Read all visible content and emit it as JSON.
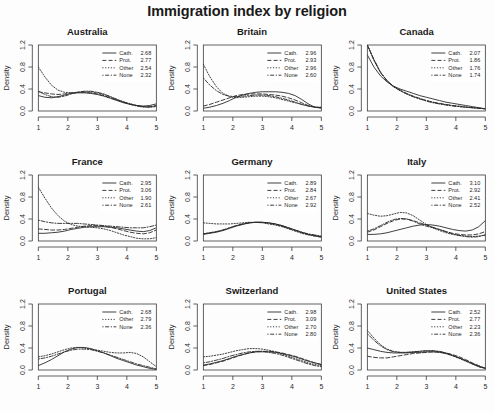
{
  "chart_data": {
    "type": "line",
    "title": "Immigration index by religion",
    "xlabel": "",
    "ylabel": "Density",
    "xlim": [
      1,
      5
    ],
    "ylim": [
      0.0,
      1.2
    ],
    "xticks": [
      "1",
      "2",
      "3",
      "4",
      "5"
    ],
    "yticks": [
      "0.0",
      "0.4",
      "0.8",
      "1.2"
    ],
    "grid": false,
    "legend_position": "top-right",
    "layout": "3x3 small multiples",
    "series_names": [
      "Cath.",
      "Prot.",
      "Other",
      "None"
    ],
    "line_styles": [
      "solid",
      "dashed",
      "dotted",
      "dotdash"
    ],
    "panels": [
      {
        "name": "Australia",
        "legend": [
          {
            "label": "Cath.",
            "value": "2.68",
            "style": "solid"
          },
          {
            "label": "Prot.",
            "value": "2.77",
            "style": "dashed"
          },
          {
            "label": "Other",
            "value": "2.54",
            "style": "dotted"
          },
          {
            "label": "None",
            "value": "2.32",
            "style": "dotdash"
          }
        ],
        "curves": {
          "Cath.": [
            0.28,
            0.25,
            0.24,
            0.26,
            0.29,
            0.32,
            0.33,
            0.33,
            0.32,
            0.3,
            0.27,
            0.23,
            0.19,
            0.15,
            0.12,
            0.1,
            0.09,
            0.1,
            0.13
          ],
          "Prot.": [
            0.35,
            0.33,
            0.31,
            0.3,
            0.31,
            0.33,
            0.34,
            0.34,
            0.33,
            0.31,
            0.28,
            0.24,
            0.2,
            0.16,
            0.13,
            0.1,
            0.08,
            0.08,
            0.1
          ],
          "Other": [
            0.8,
            0.62,
            0.47,
            0.38,
            0.34,
            0.33,
            0.34,
            0.35,
            0.35,
            0.33,
            0.3,
            0.26,
            0.21,
            0.17,
            0.13,
            0.1,
            0.08,
            0.07,
            0.08
          ],
          "None": [
            0.36,
            0.3,
            0.26,
            0.25,
            0.27,
            0.31,
            0.34,
            0.36,
            0.36,
            0.34,
            0.31,
            0.26,
            0.21,
            0.16,
            0.12,
            0.09,
            0.07,
            0.07,
            0.09
          ]
        }
      },
      {
        "name": "Britain",
        "legend": [
          {
            "label": "Cath.",
            "value": "2.96",
            "style": "solid"
          },
          {
            "label": "Prot.",
            "value": "2.93",
            "style": "dashed"
          },
          {
            "label": "Other",
            "value": "2.96",
            "style": "dotted"
          },
          {
            "label": "None",
            "value": "2.60",
            "style": "dotdash"
          }
        ],
        "curves": {
          "Cath.": [
            0.05,
            0.07,
            0.1,
            0.14,
            0.19,
            0.25,
            0.29,
            0.32,
            0.34,
            0.35,
            0.35,
            0.35,
            0.34,
            0.32,
            0.28,
            0.21,
            0.13,
            0.07,
            0.05
          ],
          "Prot.": [
            0.09,
            0.12,
            0.16,
            0.2,
            0.24,
            0.28,
            0.3,
            0.31,
            0.31,
            0.31,
            0.3,
            0.29,
            0.27,
            0.24,
            0.2,
            0.15,
            0.1,
            0.07,
            0.06
          ],
          "Other": [
            0.85,
            0.62,
            0.44,
            0.32,
            0.26,
            0.24,
            0.25,
            0.26,
            0.27,
            0.27,
            0.26,
            0.24,
            0.21,
            0.18,
            0.15,
            0.12,
            0.09,
            0.07,
            0.07
          ],
          "None": [
            0.6,
            0.47,
            0.37,
            0.3,
            0.27,
            0.26,
            0.27,
            0.28,
            0.29,
            0.29,
            0.28,
            0.26,
            0.23,
            0.2,
            0.16,
            0.12,
            0.09,
            0.07,
            0.06
          ]
        }
      },
      {
        "name": "Canada",
        "legend": [
          {
            "label": "Cath.",
            "value": "2.07",
            "style": "solid"
          },
          {
            "label": "Prot.",
            "value": "1.86",
            "style": "dashed"
          },
          {
            "label": "Other",
            "value": "1.76",
            "style": "dotted"
          },
          {
            "label": "None",
            "value": "1.74",
            "style": "dotdash"
          }
        ],
        "curves": {
          "Cath.": [
            1.02,
            0.8,
            0.64,
            0.53,
            0.45,
            0.4,
            0.36,
            0.32,
            0.28,
            0.25,
            0.22,
            0.19,
            0.16,
            0.14,
            0.12,
            0.1,
            0.08,
            0.06,
            0.04
          ],
          "Prot.": [
            1.22,
            0.93,
            0.7,
            0.55,
            0.45,
            0.38,
            0.32,
            0.27,
            0.23,
            0.19,
            0.16,
            0.14,
            0.12,
            0.1,
            0.09,
            0.07,
            0.06,
            0.05,
            0.04
          ],
          "Other": [
            1.2,
            0.92,
            0.7,
            0.55,
            0.44,
            0.37,
            0.31,
            0.26,
            0.22,
            0.19,
            0.16,
            0.13,
            0.11,
            0.1,
            0.08,
            0.07,
            0.06,
            0.05,
            0.04
          ],
          "None": [
            1.24,
            0.94,
            0.71,
            0.55,
            0.44,
            0.37,
            0.31,
            0.26,
            0.22,
            0.18,
            0.15,
            0.13,
            0.11,
            0.09,
            0.08,
            0.07,
            0.06,
            0.05,
            0.04
          ]
        }
      },
      {
        "name": "France",
        "legend": [
          {
            "label": "Cath.",
            "value": "2.95",
            "style": "solid"
          },
          {
            "label": "Prot.",
            "value": "3.06",
            "style": "dashed"
          },
          {
            "label": "Other",
            "value": "1.90",
            "style": "dotted"
          },
          {
            "label": "None",
            "value": "2.61",
            "style": "dotdash"
          }
        ],
        "curves": {
          "Cath.": [
            0.14,
            0.14,
            0.15,
            0.16,
            0.18,
            0.21,
            0.23,
            0.25,
            0.26,
            0.26,
            0.26,
            0.25,
            0.24,
            0.22,
            0.2,
            0.18,
            0.17,
            0.19,
            0.24
          ],
          "Prot.": [
            0.22,
            0.21,
            0.2,
            0.2,
            0.21,
            0.23,
            0.25,
            0.27,
            0.28,
            0.28,
            0.27,
            0.25,
            0.22,
            0.19,
            0.16,
            0.14,
            0.13,
            0.15,
            0.2
          ],
          "Other": [
            0.98,
            0.78,
            0.6,
            0.46,
            0.36,
            0.3,
            0.27,
            0.26,
            0.25,
            0.24,
            0.22,
            0.19,
            0.15,
            0.11,
            0.08,
            0.05,
            0.04,
            0.04,
            0.06
          ],
          "None": [
            0.38,
            0.35,
            0.33,
            0.32,
            0.32,
            0.32,
            0.32,
            0.31,
            0.3,
            0.29,
            0.28,
            0.27,
            0.26,
            0.25,
            0.24,
            0.24,
            0.24,
            0.26,
            0.29
          ]
        }
      },
      {
        "name": "Germany",
        "legend": [
          {
            "label": "Cath.",
            "value": "2.89",
            "style": "solid"
          },
          {
            "label": "Prot.",
            "value": "2.84",
            "style": "dashed"
          },
          {
            "label": "Other",
            "value": "2.67",
            "style": "dotted"
          },
          {
            "label": "None",
            "value": "2.92",
            "style": "dotdash"
          }
        ],
        "curves": {
          "Cath.": [
            0.12,
            0.14,
            0.16,
            0.19,
            0.23,
            0.27,
            0.3,
            0.33,
            0.34,
            0.34,
            0.33,
            0.31,
            0.28,
            0.24,
            0.2,
            0.16,
            0.12,
            0.1,
            0.08
          ],
          "Prot.": [
            0.13,
            0.15,
            0.17,
            0.2,
            0.24,
            0.28,
            0.31,
            0.33,
            0.34,
            0.34,
            0.32,
            0.3,
            0.27,
            0.23,
            0.19,
            0.15,
            0.12,
            0.09,
            0.07
          ],
          "Other": [
            0.33,
            0.32,
            0.31,
            0.31,
            0.31,
            0.32,
            0.33,
            0.34,
            0.34,
            0.33,
            0.31,
            0.29,
            0.26,
            0.22,
            0.18,
            0.14,
            0.11,
            0.09,
            0.07
          ],
          "None": [
            0.13,
            0.15,
            0.17,
            0.2,
            0.24,
            0.28,
            0.31,
            0.33,
            0.34,
            0.34,
            0.33,
            0.31,
            0.28,
            0.24,
            0.2,
            0.16,
            0.13,
            0.11,
            0.09
          ]
        }
      },
      {
        "name": "Italy",
        "legend": [
          {
            "label": "Cath.",
            "value": "3.10",
            "style": "solid"
          },
          {
            "label": "Prot.",
            "value": "2.92",
            "style": "dashed"
          },
          {
            "label": "Other",
            "value": "2.41",
            "style": "dotted"
          },
          {
            "label": "None",
            "value": "2.52",
            "style": "dotdash"
          }
        ],
        "curves": {
          "Cath.": [
            0.12,
            0.12,
            0.13,
            0.15,
            0.18,
            0.21,
            0.24,
            0.27,
            0.29,
            0.3,
            0.29,
            0.27,
            0.24,
            0.21,
            0.19,
            0.18,
            0.2,
            0.26,
            0.37
          ],
          "Prot.": [
            0.16,
            0.2,
            0.26,
            0.32,
            0.37,
            0.4,
            0.4,
            0.37,
            0.33,
            0.29,
            0.25,
            0.21,
            0.17,
            0.14,
            0.12,
            0.11,
            0.11,
            0.13,
            0.17
          ],
          "Other": [
            0.5,
            0.47,
            0.45,
            0.46,
            0.49,
            0.52,
            0.51,
            0.46,
            0.38,
            0.3,
            0.24,
            0.19,
            0.15,
            0.12,
            0.1,
            0.09,
            0.08,
            0.09,
            0.11
          ],
          "None": [
            0.18,
            0.22,
            0.28,
            0.34,
            0.39,
            0.41,
            0.4,
            0.36,
            0.31,
            0.27,
            0.24,
            0.21,
            0.17,
            0.13,
            0.1,
            0.08,
            0.07,
            0.08,
            0.11
          ]
        }
      },
      {
        "name": "Portugal",
        "legend": [
          {
            "label": "Cath.",
            "value": "2.68",
            "style": "solid"
          },
          {
            "label": "Other",
            "value": "2.79",
            "style": "dotted"
          },
          {
            "label": "None",
            "value": "2.36",
            "style": "dotdash"
          }
        ],
        "curves": {
          "Cath.": [
            0.08,
            0.13,
            0.19,
            0.26,
            0.33,
            0.38,
            0.41,
            0.41,
            0.39,
            0.35,
            0.31,
            0.26,
            0.21,
            0.17,
            0.13,
            0.09,
            0.06,
            0.03,
            0.01
          ],
          "Other": [
            0.24,
            0.26,
            0.29,
            0.33,
            0.37,
            0.4,
            0.41,
            0.4,
            0.38,
            0.36,
            0.34,
            0.32,
            0.31,
            0.31,
            0.32,
            0.3,
            0.24,
            0.15,
            0.06
          ],
          "None": [
            0.2,
            0.22,
            0.25,
            0.29,
            0.33,
            0.36,
            0.38,
            0.38,
            0.37,
            0.34,
            0.31,
            0.27,
            0.23,
            0.19,
            0.15,
            0.11,
            0.08,
            0.05,
            0.02
          ]
        }
      },
      {
        "name": "Switzerland",
        "legend": [
          {
            "label": "Cath.",
            "value": "2.98",
            "style": "solid"
          },
          {
            "label": "Prot.",
            "value": "3.09",
            "style": "dashed"
          },
          {
            "label": "Other",
            "value": "2.70",
            "style": "dotted"
          },
          {
            "label": "None",
            "value": "2.80",
            "style": "dotdash"
          }
        ],
        "curves": {
          "Cath.": [
            0.09,
            0.11,
            0.14,
            0.17,
            0.21,
            0.25,
            0.28,
            0.31,
            0.33,
            0.33,
            0.33,
            0.32,
            0.3,
            0.27,
            0.24,
            0.2,
            0.16,
            0.13,
            0.1
          ],
          "Prot.": [
            0.08,
            0.1,
            0.13,
            0.16,
            0.2,
            0.24,
            0.28,
            0.31,
            0.33,
            0.34,
            0.34,
            0.33,
            0.31,
            0.28,
            0.25,
            0.21,
            0.17,
            0.13,
            0.1
          ],
          "Other": [
            0.24,
            0.25,
            0.27,
            0.29,
            0.32,
            0.35,
            0.37,
            0.39,
            0.39,
            0.38,
            0.36,
            0.33,
            0.29,
            0.25,
            0.21,
            0.17,
            0.13,
            0.1,
            0.08
          ],
          "None": [
            0.13,
            0.15,
            0.18,
            0.21,
            0.25,
            0.28,
            0.31,
            0.33,
            0.34,
            0.34,
            0.32,
            0.3,
            0.27,
            0.23,
            0.19,
            0.15,
            0.11,
            0.08,
            0.06
          ]
        }
      },
      {
        "name": "United States",
        "legend": [
          {
            "label": "Cath.",
            "value": "2.52",
            "style": "solid"
          },
          {
            "label": "Prot.",
            "value": "2.77",
            "style": "dashed"
          },
          {
            "label": "Other",
            "value": "2.23",
            "style": "dotted"
          },
          {
            "label": "None",
            "value": "2.36",
            "style": "dotdash"
          }
        ],
        "curves": {
          "Cath.": [
            0.4,
            0.37,
            0.34,
            0.32,
            0.31,
            0.31,
            0.31,
            0.32,
            0.32,
            0.33,
            0.33,
            0.32,
            0.3,
            0.26,
            0.22,
            0.17,
            0.12,
            0.07,
            0.03
          ],
          "Prot.": [
            0.25,
            0.23,
            0.22,
            0.22,
            0.24,
            0.26,
            0.28,
            0.3,
            0.31,
            0.32,
            0.33,
            0.33,
            0.31,
            0.28,
            0.24,
            0.19,
            0.13,
            0.08,
            0.03
          ],
          "Other": [
            0.72,
            0.58,
            0.46,
            0.38,
            0.34,
            0.32,
            0.32,
            0.33,
            0.34,
            0.35,
            0.35,
            0.33,
            0.3,
            0.26,
            0.21,
            0.16,
            0.11,
            0.06,
            0.03
          ],
          "None": [
            0.66,
            0.54,
            0.44,
            0.37,
            0.33,
            0.32,
            0.32,
            0.33,
            0.34,
            0.35,
            0.35,
            0.34,
            0.31,
            0.27,
            0.22,
            0.17,
            0.11,
            0.06,
            0.03
          ]
        }
      }
    ]
  }
}
